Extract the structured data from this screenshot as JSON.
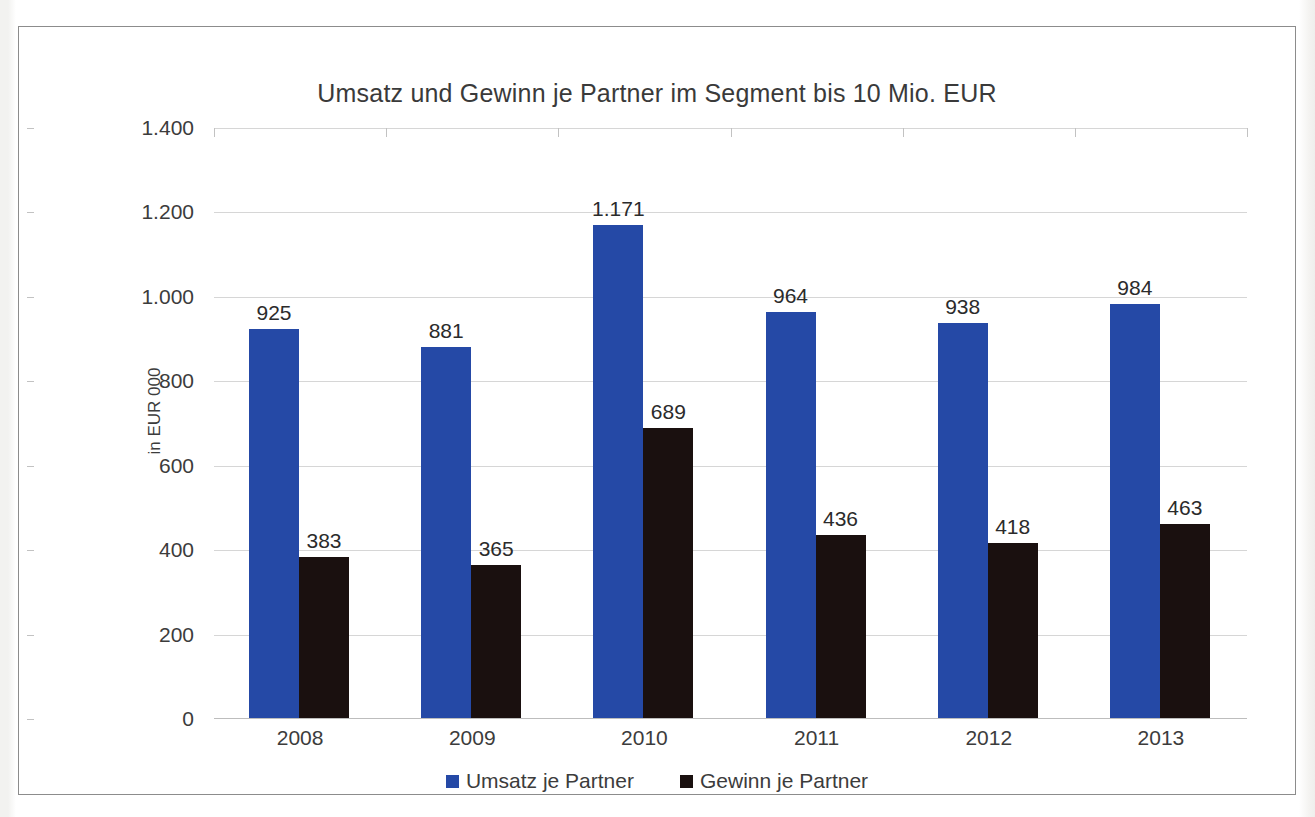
{
  "chart_data": {
    "type": "bar",
    "title": "Umsatz und Gewinn je Partner im Segment bis 10 Mio. EUR",
    "xlabel": "",
    "ylabel": "in EUR 000",
    "categories": [
      "2008",
      "2009",
      "2010",
      "2011",
      "2012",
      "2013"
    ],
    "series": [
      {
        "name": "Umsatz je Partner",
        "color": "#2549a6",
        "values": [
          925,
          881,
          1171,
          964,
          938,
          984
        ],
        "labels": [
          "925",
          "881",
          "1.171",
          "964",
          "938",
          "984"
        ]
      },
      {
        "name": "Gewinn je Partner",
        "color": "#1a100f",
        "values": [
          383,
          365,
          689,
          436,
          418,
          463
        ],
        "labels": [
          "383",
          "365",
          "689",
          "436",
          "418",
          "463"
        ]
      }
    ],
    "ylim": [
      0,
      1400
    ],
    "ytick_values": [
      0,
      200,
      400,
      600,
      800,
      1000,
      1200,
      1400
    ],
    "ytick_labels": [
      "0",
      "200",
      "400",
      "600",
      "800",
      "1.000",
      "1.200",
      "1.400"
    ],
    "grid": true,
    "legend_position": "bottom"
  },
  "legend": [
    {
      "label": "Umsatz je Partner",
      "color": "#2549a6"
    },
    {
      "label": "Gewinn je Partner",
      "color": "#1a100f"
    }
  ]
}
